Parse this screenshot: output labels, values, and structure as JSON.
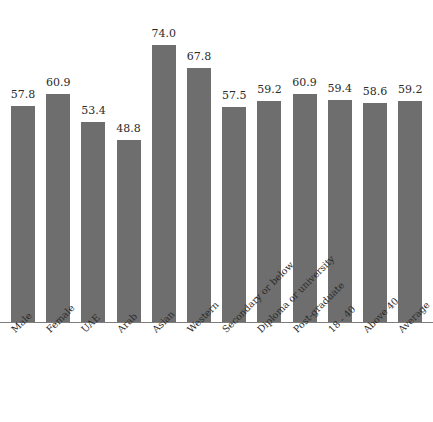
{
  "chart_data": {
    "type": "bar",
    "title": "",
    "xlabel": "",
    "ylabel": "",
    "ylim": [
      0,
      80
    ],
    "grid": false,
    "legend": null,
    "value_label_format": "one-decimal",
    "bar_color": "#6e6e6e",
    "background_color": "#ffffff",
    "axis_color": "#7c7c7c",
    "categories": [
      "Male",
      "Female",
      "UAE",
      "Arab",
      "Asian",
      "Western",
      "Secondary or below",
      "Diploma or university",
      "Post-graduate",
      "18 - 40",
      "Above 40",
      "Average"
    ],
    "values": [
      57.8,
      60.9,
      53.4,
      48.8,
      74.0,
      67.8,
      57.5,
      59.2,
      60.9,
      59.4,
      58.6,
      59.2
    ],
    "value_labels": [
      "57.8",
      "60.9",
      "53.4",
      "48.8",
      "74.0",
      "67.8",
      "57.5",
      "59.2",
      "60.9",
      "59.4",
      "58.6",
      "59.2"
    ]
  }
}
